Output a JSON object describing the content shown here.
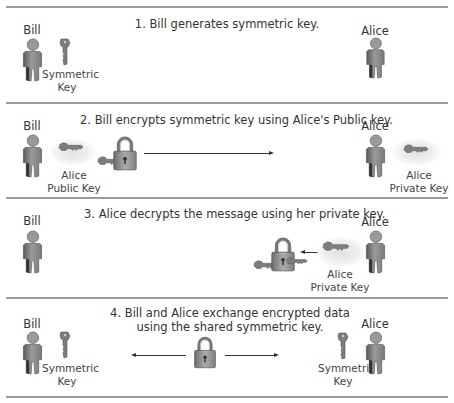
{
  "colors": {
    "divider": "#9a9a9a",
    "text": "#333333",
    "person": "#8a8a8a",
    "key": "#7a7a7a",
    "lock": "#9a9a9a"
  },
  "icons": {
    "person": "person-icon",
    "key": "key-icon",
    "lock": "padlock-icon",
    "arrow": "arrow-icon"
  },
  "panels": [
    {
      "step": 1,
      "title": "1. Bill generates symmetric key.",
      "left_name": "Bill",
      "right_name": "Alice",
      "left_key_label_1": "Symmetric",
      "left_key_label_2": "Key"
    },
    {
      "step": 2,
      "title": "2. Bill encrypts symmetric key using Alice's Public key.",
      "left_name": "Bill",
      "right_name": "Alice",
      "left_key_label_1": "Alice",
      "left_key_label_2": "Public Key",
      "right_key_label_1": "Alice",
      "right_key_label_2": "Private Key"
    },
    {
      "step": 3,
      "title": "3. Alice decrypts the message using her private key.",
      "left_name": "Bill",
      "right_name": "Alice",
      "right_key_label_1": "Alice",
      "right_key_label_2": "Private Key"
    },
    {
      "step": 4,
      "title_line1": "4. Bill and Alice exchange encrypted data",
      "title_line2": "using the shared symmetric key.",
      "left_name": "Bill",
      "right_name": "Alice",
      "left_key_label_1": "Symmetric",
      "left_key_label_2": "Key",
      "right_key_label_1": "Symmetric",
      "right_key_label_2": "Key"
    }
  ]
}
